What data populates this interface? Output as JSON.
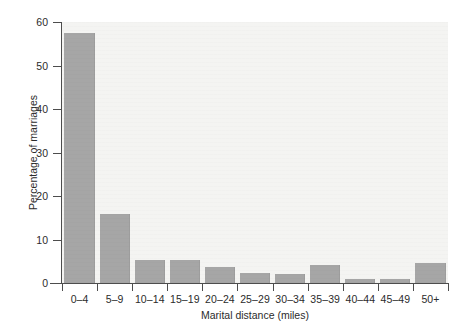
{
  "chart_data": {
    "type": "bar",
    "title": "",
    "subtitle": "",
    "xlabel": "Marital distance (miles)",
    "ylabel": "Percentage of marriages",
    "categories": [
      "0–4",
      "5–9",
      "10–14",
      "15–19",
      "20–24",
      "25–29",
      "30–34",
      "35–39",
      "40–44",
      "45–49",
      "50+"
    ],
    "values": [
      57.5,
      15.9,
      5.3,
      5.3,
      3.6,
      2.4,
      2.1,
      4.2,
      1.0,
      1.0,
      4.7
    ],
    "series": [
      {
        "name": "Percentage of marriages",
        "values": [
          57.5,
          15.9,
          5.3,
          5.3,
          3.6,
          2.4,
          2.1,
          4.2,
          1.0,
          1.0,
          4.7
        ]
      }
    ],
    "ylim": [
      0,
      60
    ],
    "xlim_categorical": true,
    "yticks": [
      0,
      10,
      20,
      30,
      40,
      50,
      60
    ],
    "ytick_labels": [
      "0",
      "10",
      "20",
      "30",
      "40",
      "50",
      "60"
    ],
    "grid": false,
    "legend": null,
    "legend_position": "none",
    "annotations": [],
    "colors": {
      "bar_fill": "#a6a6a6",
      "plot_background": "#f4f4f2",
      "figure_background": "#ffffff",
      "axis_line": "#4d4d4d",
      "text": "#2b2b2b"
    }
  }
}
